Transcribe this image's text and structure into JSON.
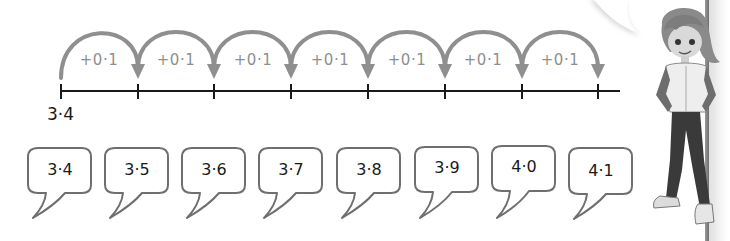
{
  "number_line": {
    "start_label": "3·4",
    "step_label": "+0·1",
    "jumps": [
      {
        "label": "+0·1"
      },
      {
        "label": "+0·1"
      },
      {
        "label": "+0·1"
      },
      {
        "label": "+0·1"
      },
      {
        "label": "+0·1"
      },
      {
        "label": "+0·1"
      },
      {
        "label": "+0·1"
      }
    ],
    "tick_count": 8
  },
  "bubbles": [
    {
      "value": "3·4"
    },
    {
      "value": "3·5"
    },
    {
      "value": "3·6"
    },
    {
      "value": "3·7"
    },
    {
      "value": "3·8"
    },
    {
      "value": "3·9"
    },
    {
      "value": "4·0"
    },
    {
      "value": "4·1"
    }
  ],
  "colors": {
    "arc": "#8f8f8f",
    "line": "#1a1a1a",
    "bubble_stroke": "#6f6f6f",
    "text": "#1a1a1a"
  },
  "character": {
    "icon": "girl-character-illustration"
  }
}
